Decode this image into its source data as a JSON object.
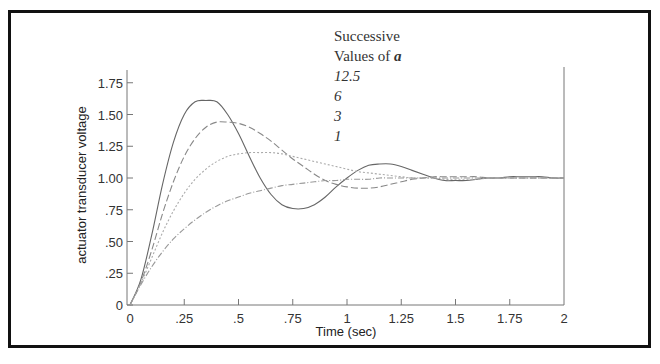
{
  "chart_data": {
    "type": "line",
    "title": "",
    "xlabel": "Time (sec)",
    "ylabel": "actuator transducer voltage",
    "xlim": [
      0,
      2
    ],
    "ylim": [
      0,
      1.85
    ],
    "grid": false,
    "x_ticks": [
      "0",
      ".25",
      ".5",
      ".75",
      "1",
      "1.25",
      "1.5",
      "1.75",
      "2"
    ],
    "y_ticks": [
      "0",
      ".25",
      ".50",
      ".75",
      "1.00",
      "1.25",
      "1.50",
      "1.75"
    ],
    "legend": {
      "title_line1": "Successive",
      "title_line2": "Values of",
      "symbol": "a",
      "entries": [
        "12.5",
        "6",
        "3",
        "1"
      ],
      "position": "top-center"
    },
    "x": [
      0,
      0.05,
      0.1,
      0.15,
      0.2,
      0.25,
      0.3,
      0.35,
      0.4,
      0.45,
      0.5,
      0.55,
      0.6,
      0.65,
      0.7,
      0.75,
      0.8,
      0.85,
      0.9,
      0.95,
      1.0,
      1.05,
      1.1,
      1.15,
      1.2,
      1.25,
      1.3,
      1.35,
      1.4,
      1.45,
      1.5,
      1.55,
      1.6,
      1.65,
      1.7,
      1.75,
      1.8,
      1.85,
      1.9,
      1.95,
      2.0
    ],
    "series": [
      {
        "name": "12.5",
        "style": "solid",
        "color": "#666666",
        "values": [
          0,
          0.2,
          0.55,
          0.95,
          1.28,
          1.5,
          1.6,
          1.61,
          1.6,
          1.5,
          1.35,
          1.17,
          1.0,
          0.87,
          0.79,
          0.76,
          0.76,
          0.79,
          0.85,
          0.93,
          1.0,
          1.06,
          1.1,
          1.11,
          1.11,
          1.09,
          1.06,
          1.03,
          1.0,
          0.98,
          0.98,
          0.98,
          0.99,
          1.0,
          1.0,
          1.01,
          1.01,
          1.01,
          1.01,
          1.0,
          1.0
        ]
      },
      {
        "name": "6",
        "style": "dashed",
        "color": "#888888",
        "values": [
          0,
          0.18,
          0.43,
          0.72,
          0.97,
          1.17,
          1.31,
          1.4,
          1.44,
          1.44,
          1.43,
          1.4,
          1.35,
          1.29,
          1.22,
          1.15,
          1.09,
          1.03,
          0.98,
          0.95,
          0.93,
          0.92,
          0.92,
          0.93,
          0.95,
          0.97,
          0.99,
          1.0,
          1.01,
          1.01,
          1.01,
          1.01,
          1.01,
          1.0,
          1.0,
          1.0,
          1.0,
          1.0,
          1.0,
          1.0,
          1.0
        ]
      },
      {
        "name": "3",
        "style": "dotted",
        "color": "#aaaaaa",
        "values": [
          0,
          0.17,
          0.37,
          0.57,
          0.74,
          0.88,
          0.99,
          1.07,
          1.13,
          1.17,
          1.19,
          1.2,
          1.2,
          1.2,
          1.19,
          1.17,
          1.15,
          1.13,
          1.11,
          1.09,
          1.07,
          1.05,
          1.04,
          1.03,
          1.02,
          1.01,
          1.0,
          1.0,
          1.0,
          0.99,
          0.99,
          0.99,
          0.99,
          1.0,
          1.0,
          1.0,
          1.0,
          1.0,
          1.0,
          1.0,
          1.0
        ]
      },
      {
        "name": "1",
        "style": "dashdot",
        "color": "#999999",
        "values": [
          0,
          0.16,
          0.3,
          0.42,
          0.52,
          0.6,
          0.67,
          0.73,
          0.78,
          0.82,
          0.85,
          0.88,
          0.9,
          0.92,
          0.94,
          0.95,
          0.96,
          0.97,
          0.98,
          0.98,
          0.99,
          0.99,
          0.99,
          1.0,
          1.0,
          1.0,
          1.0,
          1.0,
          1.0,
          1.0,
          1.0,
          1.0,
          1.0,
          1.0,
          1.0,
          1.0,
          1.0,
          1.0,
          1.0,
          1.0,
          1.0
        ]
      }
    ]
  }
}
